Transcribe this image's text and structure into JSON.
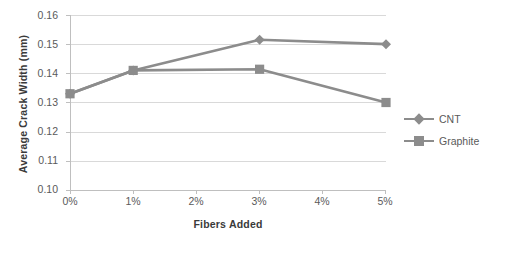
{
  "chart_data": {
    "type": "line",
    "title": "",
    "xlabel": "Fibers Added",
    "ylabel": "Average Crack Width (mm)",
    "categories": [
      "0%",
      "1%",
      "2%",
      "3%",
      "4%",
      "5%"
    ],
    "x": [
      0,
      1,
      2,
      3,
      4,
      5
    ],
    "xlim": [
      0,
      5
    ],
    "ylim": [
      0.1,
      0.16
    ],
    "yticks": [
      "0.10",
      "0.11",
      "0.12",
      "0.13",
      "0.14",
      "0.15",
      "0.16"
    ],
    "ytick_values": [
      0.1,
      0.11,
      0.12,
      0.13,
      0.14,
      0.15,
      0.16
    ],
    "grid": true,
    "grid_axis": "y",
    "legend_position": "right",
    "series": [
      {
        "name": "CNT",
        "marker": "diamond",
        "color": "#8c8c8c",
        "x": [
          0,
          1,
          3,
          5
        ],
        "x_labels": [
          "0%",
          "1%",
          "3%",
          "5%"
        ],
        "values": [
          0.133,
          0.141,
          0.1515,
          0.15
        ]
      },
      {
        "name": "Graphite",
        "marker": "square",
        "color": "#8c8c8c",
        "x": [
          0,
          1,
          3,
          5
        ],
        "x_labels": [
          "0%",
          "1%",
          "3%",
          "5%"
        ],
        "values": [
          0.133,
          0.141,
          0.1414,
          0.13
        ]
      }
    ]
  },
  "axes": {
    "y_title": "Average Crack Width (mm)",
    "x_title": "Fibers Added",
    "y_tick_labels": [
      "0.16",
      "0.15",
      "0.14",
      "0.13",
      "0.12",
      "0.11",
      "0.10"
    ],
    "x_tick_labels": [
      "0%",
      "1%",
      "2%",
      "3%",
      "4%",
      "5%"
    ]
  },
  "legend": {
    "items": [
      {
        "label": "CNT",
        "marker": "diamond-marker-icon"
      },
      {
        "label": "Graphite",
        "marker": "square-marker-icon"
      }
    ]
  },
  "colors": {
    "series": "#8c8c8c",
    "gridline": "#d9d9d9",
    "axis": "#bfbfbf",
    "tick_text": "#5a5a5a",
    "title_text": "#3a3a3a",
    "background": "#ffffff"
  }
}
